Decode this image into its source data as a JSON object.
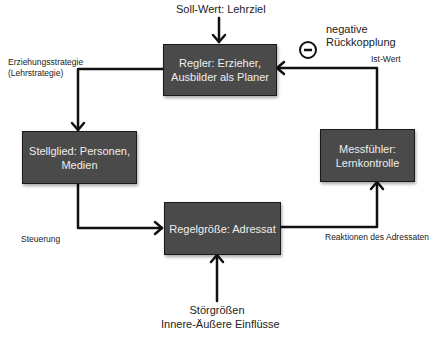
{
  "boxes": {
    "regler": {
      "line1": "Regler: Erzieher,",
      "line2": "Ausbilder als Planer"
    },
    "stellglied": {
      "line1": "Stellglied: Personen,",
      "line2": "Medien"
    },
    "regelgroesse": {
      "line1": "Regelgröße: Adressat"
    },
    "messfuehler": {
      "line1": "Messfühler:",
      "line2": "Lernkontrolle"
    }
  },
  "labels": {
    "soll_wert": "Soll-Wert: Lehrziel",
    "negative_line1": "negative",
    "negative_line2": "Rückkopplung",
    "minus_symbol": "−",
    "ist_wert": "Ist-Wert",
    "erziehung_line1": "Erziehungsstrategie",
    "erziehung_line2": "(Lehrstrategie)",
    "steuerung": "Steuerung",
    "reaktionen": "Reaktionen des Adressaten",
    "stoer_line1": "Störgrößen",
    "stoer_line2": "Innere-Äußere Einflüsse"
  },
  "colors": {
    "box_fill": "#4a4a4a",
    "box_text": "#eeeeee",
    "line": "#111111"
  }
}
